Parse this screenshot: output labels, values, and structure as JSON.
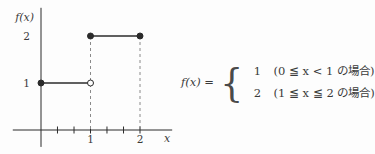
{
  "figure": {
    "background": "#fdfdfd",
    "line_color": "#2b2b2b",
    "dash_color": "#8a8a8a",
    "text_color": "#3a3a3a"
  },
  "chart_data": {
    "type": "line",
    "subtype": "step-function",
    "title": "",
    "xlabel": "x",
    "ylabel": "f(x)",
    "xlim": [
      -0.57,
      2.65
    ],
    "ylim": [
      -0.36,
      2.6
    ],
    "grid": false,
    "legend": false,
    "segments": [
      {
        "y": 1,
        "x_from": 0,
        "x_to": 1,
        "start_closed": true,
        "end_closed": false
      },
      {
        "y": 2,
        "x_from": 1,
        "x_to": 2,
        "start_closed": true,
        "end_closed": true
      }
    ],
    "dashed_drops": [
      {
        "x": 1,
        "y_top": 2
      },
      {
        "x": 2,
        "y_top": 2
      }
    ],
    "x_ticks": [
      0.333,
      0.667,
      1,
      1.333,
      1.667,
      2
    ],
    "x_tick_labels": [
      {
        "x": 1,
        "label": "1"
      },
      {
        "x": 2,
        "label": "2"
      }
    ],
    "y_value_labels": [
      {
        "y": 1,
        "label": "1"
      },
      {
        "y": 2,
        "label": "2"
      }
    ]
  },
  "equation": {
    "lhs": "f(x) =",
    "brace": "{",
    "cases": [
      {
        "value": "1",
        "condition": "(0 ≦ x < 1 の場合)"
      },
      {
        "value": "2",
        "condition": "(1 ≦ x ≦ 2 の場合)"
      }
    ]
  }
}
